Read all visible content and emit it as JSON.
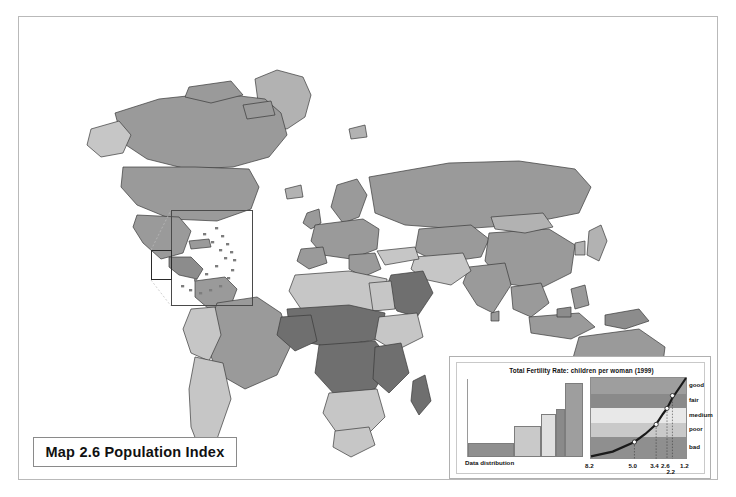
{
  "map": {
    "title": "Map 2.6 Population Index",
    "inset_name": "caribbean-detail-inset"
  },
  "legend": {
    "title": "Total Fertility Rate: children per woman (1999)",
    "distribution_label": "Data distribution",
    "class_names": [
      "good",
      "fair",
      "medium",
      "poor",
      "bad"
    ],
    "tick_labels": [
      "8.2",
      "5.0",
      "3.4",
      "2.6",
      "1.2"
    ],
    "sub_tick_label": "2.2"
  },
  "colors": {
    "good": "#9e9e9e",
    "fair": "#8a8a8a",
    "medium": "#e8e8e8",
    "poor": "#c9c9c9",
    "bad": "#8f8f8f",
    "frame": "#b9b9b9",
    "land_default": "#9a9a9a",
    "ocean": "#ffffff"
  },
  "chart_data": {
    "type": "line",
    "title": "Total Fertility Rate: children per woman (1999)",
    "xlabel": "",
    "ylabel": "",
    "x": [
      8.2,
      5.0,
      3.4,
      2.6,
      2.2,
      1.2
    ],
    "xtick_labels": [
      "8.2",
      "5.0",
      "3.4",
      "2.6",
      "2.2",
      "1.2"
    ],
    "xlim": [
      8.2,
      1.2
    ],
    "ylim": [
      0,
      100
    ],
    "grid": false,
    "legend_position": "right",
    "series": [
      {
        "name": "Population index curve",
        "x": [
          8.2,
          6.6,
          5.0,
          4.2,
          3.4,
          2.9,
          2.6,
          2.2,
          1.6,
          1.2
        ],
        "values": [
          2,
          8,
          20,
          30,
          42,
          55,
          62,
          75,
          90,
          100
        ]
      }
    ],
    "markers": [
      {
        "x": 5.0,
        "y": 20,
        "label": "bad/poor boundary"
      },
      {
        "x": 3.4,
        "y": 42,
        "label": "poor/medium boundary"
      },
      {
        "x": 2.6,
        "y": 62,
        "label": "medium/fair boundary"
      },
      {
        "x": 2.2,
        "y": 78,
        "label": "fair/good boundary"
      }
    ],
    "bands": [
      {
        "name": "good",
        "y_from": 80,
        "y_to": 100,
        "color": "#9e9e9e"
      },
      {
        "name": "fair",
        "y_from": 62,
        "y_to": 80,
        "color": "#8a8a8a"
      },
      {
        "name": "medium",
        "y_from": 44,
        "y_to": 62,
        "color": "#e8e8e8"
      },
      {
        "name": "poor",
        "y_from": 26,
        "y_to": 44,
        "color": "#c9c9c9"
      },
      {
        "name": "bad",
        "y_from": 0,
        "y_to": 26,
        "color": "#8f8f8f"
      }
    ],
    "distribution": {
      "type": "bar",
      "name": "Data distribution",
      "categories": [
        "bad",
        "poor",
        "medium",
        "fair",
        "good"
      ],
      "values": [
        18,
        40,
        55,
        62,
        95
      ],
      "widths": [
        38,
        22,
        13,
        7,
        15
      ],
      "colors": [
        "#8f8f8f",
        "#c9c9c9",
        "#e0e0e0",
        "#8a8a8a",
        "#9e9e9e"
      ]
    }
  }
}
